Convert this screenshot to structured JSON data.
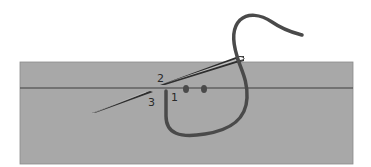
{
  "diagram": {
    "type": "embroidery-stitch-illustration",
    "colors": {
      "background": "#ffffff",
      "fabric": "#a8a8a8",
      "fabric_edge": "#8a8a8a",
      "fold_line": "#3c3c3c",
      "thread": "#4a4a4a",
      "needle": "#2e2e2e",
      "knot": "#4a4a4a"
    },
    "labels": [
      {
        "id": "point-1",
        "text": "1"
      },
      {
        "id": "point-2",
        "text": "2"
      },
      {
        "id": "point-3",
        "text": "3"
      }
    ]
  }
}
